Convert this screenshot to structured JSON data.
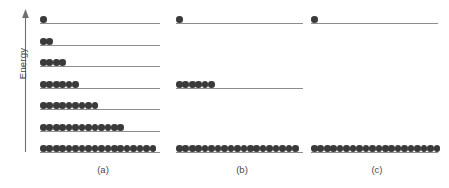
{
  "figure": {
    "axis": {
      "label": "Energy",
      "direction": "up",
      "arrow_icon": "arrow-up-icon"
    },
    "dot_color": "#3a3a3a",
    "line_color": "#8d8d8d",
    "background": "#ffffff",
    "level_count": 7,
    "level_label": "energy level"
  },
  "chart_data": {
    "type": "diagram",
    "title": "",
    "xlabel": "",
    "ylabel": "Energy",
    "panels": [
      {
        "label": "(a)",
        "total_particles": 52,
        "levels": [
          {
            "index": 7,
            "rank_from_top": 1,
            "occupancy": 1,
            "line_length_px": 120
          },
          {
            "index": 6,
            "rank_from_top": 2,
            "occupancy": 2,
            "line_length_px": 120
          },
          {
            "index": 5,
            "rank_from_top": 3,
            "occupancy": 4,
            "line_length_px": 120
          },
          {
            "index": 4,
            "rank_from_top": 4,
            "occupancy": 6,
            "line_length_px": 120
          },
          {
            "index": 3,
            "rank_from_top": 5,
            "occupancy": 9,
            "line_length_px": 120
          },
          {
            "index": 2,
            "rank_from_top": 6,
            "occupancy": 13,
            "line_length_px": 120
          },
          {
            "index": 1,
            "rank_from_top": 7,
            "occupancy": 18,
            "line_length_px": 120
          }
        ]
      },
      {
        "label": "(b)",
        "total_particles": 26,
        "levels": [
          {
            "index": 7,
            "rank_from_top": 1,
            "occupancy": 1,
            "line_length_px": 127
          },
          {
            "index": 4,
            "rank_from_top": 4,
            "occupancy": 6,
            "line_length_px": 127
          },
          {
            "index": 1,
            "rank_from_top": 7,
            "occupancy": 19,
            "line_length_px": 127
          }
        ]
      },
      {
        "label": "(c)",
        "total_particles": 21,
        "levels": [
          {
            "index": 7,
            "rank_from_top": 1,
            "occupancy": 1,
            "line_length_px": 127
          },
          {
            "index": 1,
            "rank_from_top": 7,
            "occupancy": 20,
            "line_length_px": 127
          }
        ]
      }
    ]
  }
}
